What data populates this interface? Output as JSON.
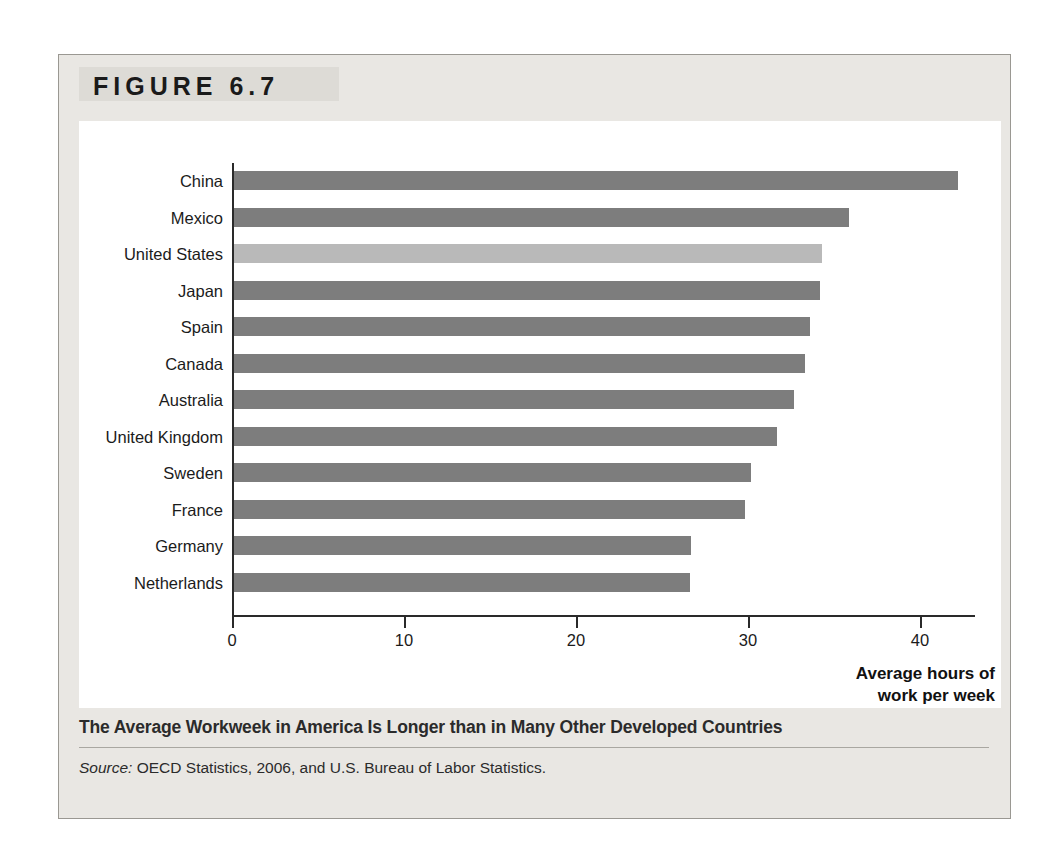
{
  "figure": {
    "label": "FIGURE 6.7",
    "caption": "The Average Workweek in America Is Longer than in Many Other Developed Countries",
    "source_word": "Source:",
    "source_text": " OECD Statistics, 2006, and U.S. Bureau of Labor Statistics."
  },
  "colors": {
    "bar_default": "#7d7d7d",
    "bar_highlight": "#b9b9b9",
    "frame_background": "#e9e7e3",
    "panel_background": "#ffffff",
    "axis": "#2a2a2a",
    "text": "#1b1b1b"
  },
  "chart_data": {
    "type": "bar",
    "orientation": "horizontal",
    "title": "",
    "xlabel": "Average hours of work per week",
    "ylabel": "",
    "xlim": [
      0,
      45
    ],
    "grid": false,
    "legend": null,
    "xticks": [
      0,
      10,
      20,
      30,
      40
    ],
    "xticklabels": [
      "0",
      "10",
      "20",
      "30",
      "40"
    ],
    "categories": [
      "China",
      "Mexico",
      "United States",
      "Japan",
      "Spain",
      "Canada",
      "Australia",
      "United Kingdom",
      "Sweden",
      "France",
      "Germany",
      "Netherlands"
    ],
    "values": [
      42.2,
      35.9,
      34.3,
      34.2,
      33.6,
      33.3,
      32.7,
      31.7,
      30.2,
      29.8,
      26.7,
      26.6
    ],
    "highlighted_category": "United States",
    "axis_label_lines": [
      "Average hours of",
      "work per week"
    ]
  }
}
